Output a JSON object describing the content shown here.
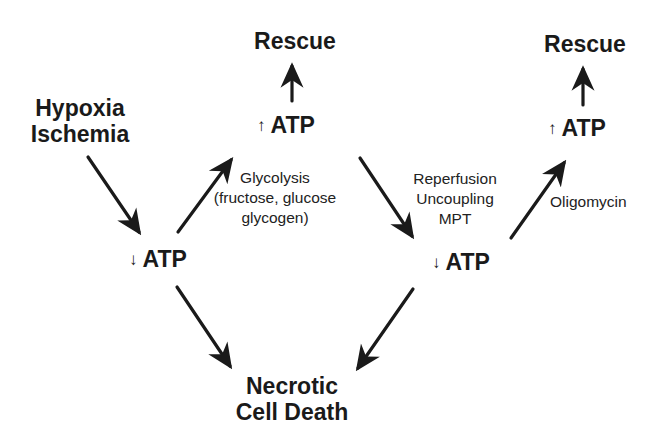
{
  "diagram": {
    "nodes": {
      "hypoxia": {
        "line1": "Hypoxia",
        "line2": "Ischemia"
      },
      "atp_down_1": {
        "symbol": "↓",
        "text": "ATP"
      },
      "atp_up_1": {
        "symbol": "↑",
        "text": "ATP"
      },
      "rescue_1": {
        "text": "Rescue"
      },
      "atp_down_2": {
        "symbol": "↓",
        "text": "ATP"
      },
      "atp_up_2": {
        "symbol": "↑",
        "text": "ATP"
      },
      "rescue_2": {
        "text": "Rescue"
      },
      "necrosis": {
        "line1": "Necrotic",
        "line2": "Cell Death"
      }
    },
    "edge_labels": {
      "glycolysis": {
        "line1": "Glycolysis",
        "line2": "(fructose, glucose",
        "line3": "glycogen)"
      },
      "reperfusion": {
        "line1": "Reperfusion",
        "line2": "Uncoupling",
        "line3": "MPT"
      },
      "oligomycin": {
        "text": "Oligomycin"
      }
    },
    "edges": [
      {
        "from": "Hypoxia Ischemia",
        "to": "↓ ATP (1)"
      },
      {
        "from": "↓ ATP (1)",
        "to": "↑ ATP (1)",
        "label": "Glycolysis (fructose, glucose glycogen)"
      },
      {
        "from": "↑ ATP (1)",
        "to": "Rescue (1)"
      },
      {
        "from": "↑ ATP (1)",
        "to": "↓ ATP (2)",
        "label": "Reperfusion Uncoupling MPT"
      },
      {
        "from": "↓ ATP (2)",
        "to": "↑ ATP (2)",
        "label": "Oligomycin"
      },
      {
        "from": "↑ ATP (2)",
        "to": "Rescue (2)"
      },
      {
        "from": "↓ ATP (1)",
        "to": "Necrotic Cell Death"
      },
      {
        "from": "↓ ATP (2)",
        "to": "Necrotic Cell Death"
      }
    ],
    "colors": {
      "text": "#1a1a1a",
      "arrow": "#1a1a1a",
      "background": "#ffffff"
    }
  }
}
